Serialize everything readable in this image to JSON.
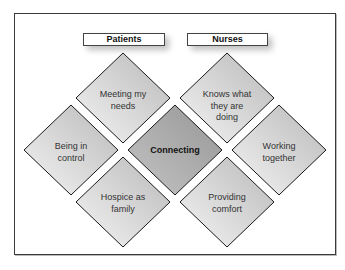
{
  "diagram": {
    "headers": {
      "patients": "Patients",
      "nurses": "Nurses"
    },
    "center": {
      "label": "Connecting"
    },
    "patient_nodes": [
      {
        "label": "Meeting my needs"
      },
      {
        "label": "Being in control"
      },
      {
        "label": "Hospice as family"
      }
    ],
    "nurse_nodes": [
      {
        "label": "Knows what they are doing"
      },
      {
        "label": "Working together"
      },
      {
        "label": "Providing comfort"
      }
    ],
    "colors": {
      "outer_diamond_light": "#f2f2f2",
      "outer_diamond_dark": "#bdbdbd",
      "center_diamond": "#a8a8a8",
      "stroke": "#1a1a1a"
    }
  }
}
